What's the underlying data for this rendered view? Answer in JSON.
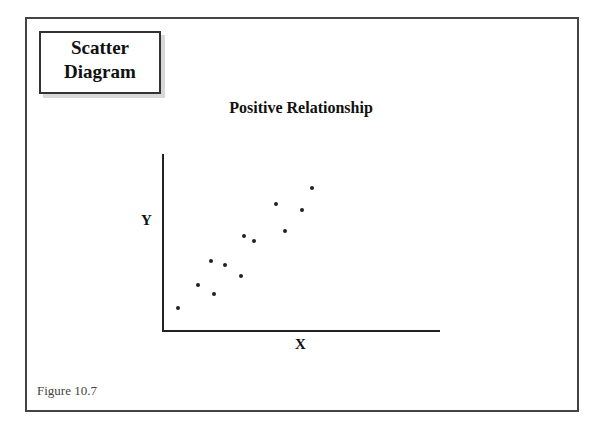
{
  "slide": {
    "title_line1": "Scatter",
    "title_line2": "Diagram",
    "figure_label": "Figure 10.7"
  },
  "chart_data": {
    "type": "scatter",
    "title": "Positive Relationship",
    "xlabel": "X",
    "ylabel": "Y",
    "grid": false,
    "legend": null,
    "axis_ticks": false,
    "points_pixel": [
      {
        "x": 178,
        "y": 308
      },
      {
        "x": 198,
        "y": 285
      },
      {
        "x": 211,
        "y": 261
      },
      {
        "x": 214,
        "y": 294
      },
      {
        "x": 225,
        "y": 265
      },
      {
        "x": 241,
        "y": 276
      },
      {
        "x": 244,
        "y": 236
      },
      {
        "x": 254,
        "y": 241
      },
      {
        "x": 276,
        "y": 204
      },
      {
        "x": 285,
        "y": 231
      },
      {
        "x": 302,
        "y": 210
      },
      {
        "x": 312,
        "y": 188
      }
    ],
    "points_relative": [
      {
        "x": 0.05,
        "y": 0.13
      },
      {
        "x": 0.13,
        "y": 0.26
      },
      {
        "x": 0.17,
        "y": 0.4
      },
      {
        "x": 0.19,
        "y": 0.21
      },
      {
        "x": 0.22,
        "y": 0.38
      },
      {
        "x": 0.28,
        "y": 0.31
      },
      {
        "x": 0.29,
        "y": 0.54
      },
      {
        "x": 0.33,
        "y": 0.51
      },
      {
        "x": 0.41,
        "y": 0.72
      },
      {
        "x": 0.44,
        "y": 0.57
      },
      {
        "x": 0.5,
        "y": 0.69
      },
      {
        "x": 0.54,
        "y": 0.81
      }
    ]
  }
}
